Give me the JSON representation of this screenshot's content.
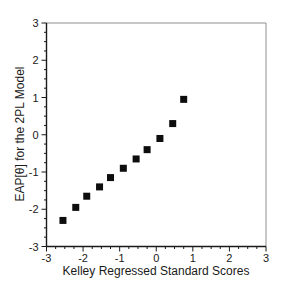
{
  "chart": {
    "xlabel": "Kelley Regressed Standard Scores",
    "ylabel": "EAP[θ] for the 2PL Model"
  },
  "chart_data": {
    "type": "scatter",
    "title": "",
    "xlabel": "Kelley Regressed Standard Scores",
    "ylabel": "EAP[θ] for the 2PL Model",
    "points": [
      [
        -2.55,
        -2.3
      ],
      [
        -2.2,
        -1.95
      ],
      [
        -1.9,
        -1.65
      ],
      [
        -1.55,
        -1.4
      ],
      [
        -1.25,
        -1.15
      ],
      [
        -0.9,
        -0.9
      ],
      [
        -0.55,
        -0.65
      ],
      [
        -0.25,
        -0.4
      ],
      [
        0.1,
        -0.1
      ],
      [
        0.45,
        0.3
      ],
      [
        0.75,
        0.95
      ]
    ],
    "xlim": [
      -3,
      3
    ],
    "ylim": [
      -3,
      3
    ],
    "x_major_ticks": [
      -3,
      -2,
      -1,
      0,
      1,
      2,
      3
    ],
    "y_major_ticks": [
      -3,
      -2,
      -1,
      0,
      1,
      2,
      3
    ],
    "x_tick_labels": [
      "-3",
      "-2",
      "-1",
      "0",
      "1",
      "2",
      "3"
    ],
    "y_tick_labels": [
      "-3",
      "-2",
      "-1",
      "0",
      "1",
      "2",
      "3"
    ],
    "minor_tick_step": 0.25,
    "grid": false,
    "legend": null,
    "marker": "filled-square",
    "marker_size_px": 7,
    "marker_color": "#0d0d0d",
    "axis_color": "#1a1a1a",
    "frame_light_color": "#8f8f8f",
    "text_color": "#1a1a1a",
    "background_color": "#ffffff"
  }
}
